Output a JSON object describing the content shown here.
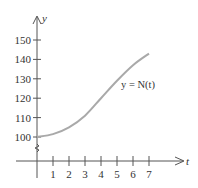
{
  "chart_data": {
    "type": "line",
    "title": "",
    "xlabel": "t",
    "ylabel": "y",
    "x": [
      0,
      1,
      2,
      3,
      4,
      5,
      6,
      7
    ],
    "series": [
      {
        "name": "y = N(t)",
        "values": [
          100,
          101.5,
          105,
          111,
          120,
          129,
          137,
          143
        ]
      }
    ],
    "x_ticks": [
      "1",
      "2",
      "3",
      "4",
      "5",
      "6",
      "7"
    ],
    "y_ticks": [
      "100",
      "110",
      "120",
      "130",
      "140",
      "150"
    ],
    "xlim": [
      0,
      7.5
    ],
    "ylim": [
      100,
      155
    ],
    "y_axis_break": true,
    "grid": false,
    "legend": "none",
    "annotations": [
      "y = N(t)"
    ]
  },
  "labels": {
    "x_axis": "t",
    "y_axis": "y",
    "curve": "y = N(t)"
  },
  "colors": {
    "axis": "#555555",
    "curve": "#a9a9a9",
    "text": "#333333"
  }
}
